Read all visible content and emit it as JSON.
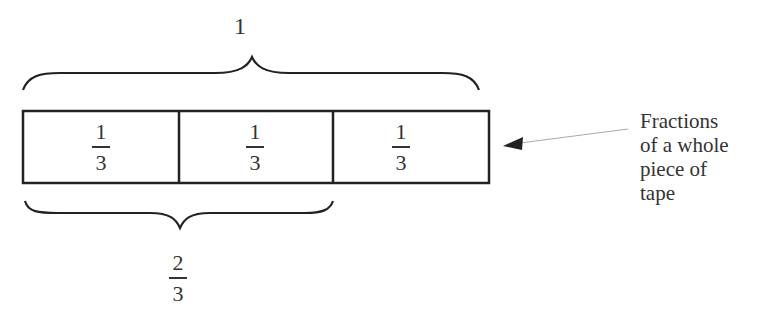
{
  "diagram": {
    "type": "tape-diagram",
    "whole_label": "1",
    "segments": [
      {
        "numerator": "1",
        "denominator": "3"
      },
      {
        "numerator": "1",
        "denominator": "3"
      },
      {
        "numerator": "1",
        "denominator": "3"
      }
    ],
    "partial_brace_label": {
      "numerator": "2",
      "denominator": "3"
    },
    "caption_lines": [
      "Fractions",
      "of a whole",
      "piece of",
      "tape"
    ],
    "colors": {
      "stroke": "#222222",
      "arrow": "#999999",
      "background": "#ffffff"
    }
  }
}
